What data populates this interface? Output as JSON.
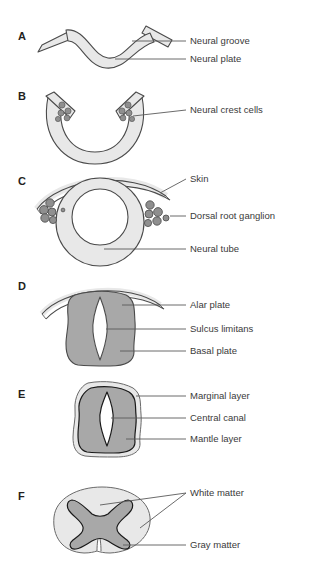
{
  "figure": {
    "background": "#ffffff",
    "palette": {
      "light_gray": "#e8e8e8",
      "mid_gray": "#dcdcdc",
      "dark_gray": "#a8a8a8",
      "cell_gray": "#8f8f8f",
      "white": "#ffffff",
      "outline": "#4a4a4a",
      "outline_black": "#1a1a1a",
      "leader": "#5a5a5a",
      "text": "#3a3a3a",
      "letter": "#231f20"
    },
    "panels": [
      {
        "id": "A",
        "letter": "A",
        "stage": "neural-plate",
        "labels": [
          {
            "key": "neural_groove",
            "text": "Neural groove"
          },
          {
            "key": "neural_plate",
            "text": "Neural plate"
          }
        ]
      },
      {
        "id": "B",
        "letter": "B",
        "stage": "neural-groove",
        "labels": [
          {
            "key": "neural_crest_cells",
            "text": "Neural crest cells"
          }
        ]
      },
      {
        "id": "C",
        "letter": "C",
        "stage": "neural-tube-closed",
        "labels": [
          {
            "key": "skin",
            "text": "Skin"
          },
          {
            "key": "dorsal_root_ganglion",
            "text": "Dorsal root ganglion"
          },
          {
            "key": "neural_tube",
            "text": "Neural tube"
          }
        ]
      },
      {
        "id": "D",
        "letter": "D",
        "stage": "alar-basal-plates",
        "labels": [
          {
            "key": "alar_plate",
            "text": "Alar plate"
          },
          {
            "key": "sulcus_limitans",
            "text": "Sulcus limitans"
          },
          {
            "key": "basal_plate",
            "text": "Basal plate"
          }
        ]
      },
      {
        "id": "E",
        "letter": "E",
        "stage": "mantle-marginal-layers",
        "labels": [
          {
            "key": "marginal_layer",
            "text": "Marginal layer"
          },
          {
            "key": "central_canal",
            "text": "Central canal"
          },
          {
            "key": "mantle_layer",
            "text": "Mantle layer"
          }
        ]
      },
      {
        "id": "F",
        "letter": "F",
        "stage": "mature-spinal-cord",
        "labels": [
          {
            "key": "white_matter",
            "text": "White matter"
          },
          {
            "key": "gray_matter",
            "text": "Gray matter"
          }
        ]
      }
    ]
  }
}
